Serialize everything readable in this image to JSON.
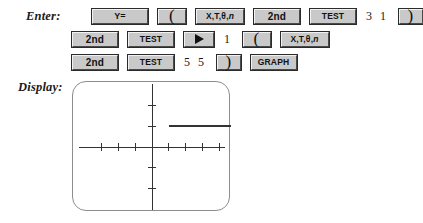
{
  "labels": {
    "enter": "Enter:",
    "display": "Display:"
  },
  "keypad": {
    "rows": [
      {
        "name": "row-1",
        "items": [
          {
            "kind": "key",
            "name": "y-equals-key",
            "label": "Y="
          },
          {
            "kind": "key",
            "name": "left-paren-key",
            "label": "("
          },
          {
            "kind": "key",
            "name": "x-t-theta-n-key",
            "label": "X,T,θ,n"
          },
          {
            "kind": "key",
            "name": "second-key",
            "label": "2nd"
          },
          {
            "kind": "key",
            "name": "test-key",
            "label": "TEST"
          },
          {
            "kind": "typed",
            "name": "typed-3-1",
            "label": "3 1"
          },
          {
            "kind": "key",
            "name": "right-paren-key",
            "label": ")"
          }
        ]
      },
      {
        "name": "row-2",
        "items": [
          {
            "kind": "key",
            "name": "second-key",
            "label": "2nd"
          },
          {
            "kind": "key",
            "name": "test-key",
            "label": "TEST"
          },
          {
            "kind": "key",
            "name": "right-arrow-key",
            "label": "▶"
          },
          {
            "kind": "typed",
            "name": "typed-1",
            "label": "1"
          },
          {
            "kind": "key",
            "name": "left-paren-key",
            "label": "("
          },
          {
            "kind": "key",
            "name": "x-t-theta-n-key",
            "label": "X,T,θ,n"
          }
        ]
      },
      {
        "name": "row-3",
        "items": [
          {
            "kind": "key",
            "name": "second-key",
            "label": "2nd"
          },
          {
            "kind": "key",
            "name": "test-key",
            "label": "TEST"
          },
          {
            "kind": "typed",
            "name": "typed-5-5",
            "label": "5 5"
          },
          {
            "kind": "key",
            "name": "right-paren-key",
            "label": ")"
          },
          {
            "kind": "key",
            "name": "graph-key",
            "label": "GRAPH"
          }
        ]
      }
    ]
  },
  "chart_data": {
    "type": "line",
    "title": "",
    "xlabel": "",
    "ylabel": "",
    "xlim": [
      -4.7,
      4.7
    ],
    "ylim": [
      -3.1,
      3.1
    ],
    "grid": false,
    "legend": "none",
    "xticks": [
      -3,
      -2,
      -1,
      1,
      2,
      3,
      4,
      5
    ],
    "yticks": [
      -3,
      -2,
      -1,
      1,
      2,
      3
    ],
    "series": [
      {
        "name": "y=(X≥31)(X≤5)",
        "x": [
          1,
          5
        ],
        "values": [
          1,
          1
        ],
        "color": "#333333"
      }
    ],
    "annotations": [
      "horizontal segment at y = 1 spanning x = 1 to x = 5"
    ]
  },
  "colors": {
    "key_face": "#c9c9c9",
    "key_text": "#111111",
    "screen_border": "#8d8d8d",
    "axis": "#333333",
    "plot_line": "#333333",
    "label_text": "#1a1a1a"
  }
}
